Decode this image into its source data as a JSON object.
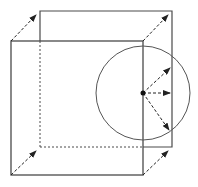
{
  "diagram": {
    "title": "",
    "colors": {
      "background": "#ffffff",
      "edge": "#4a4a4a",
      "arrow": "#222222",
      "circle": "#555555",
      "point": "#111111"
    },
    "front_face": {
      "x1": 11,
      "y1": 41,
      "x2": 143,
      "y2": 175
    },
    "back_face": {
      "x1": 40,
      "y1": 11,
      "x2": 172,
      "y2": 147
    },
    "hidden_edges": [
      {
        "x1": 40,
        "y1": 41,
        "x2": 40,
        "y2": 147
      },
      {
        "x1": 40,
        "y1": 147,
        "x2": 143,
        "y2": 147
      }
    ],
    "corner_arrows": [
      {
        "x1": 11,
        "y1": 41,
        "x2": 36,
        "y2": 15
      },
      {
        "x1": 143,
        "y1": 41,
        "x2": 168,
        "y2": 15
      },
      {
        "x1": 11,
        "y1": 175,
        "x2": 36,
        "y2": 151
      },
      {
        "x1": 143,
        "y1": 175,
        "x2": 168,
        "y2": 151
      }
    ],
    "circle": {
      "cx": 143,
      "cy": 93,
      "r": 47
    },
    "center_point": {
      "cx": 143,
      "cy": 93,
      "r": 2.5
    },
    "radial_arrows": [
      {
        "x1": 143,
        "y1": 93,
        "x2": 170,
        "y2": 68
      },
      {
        "x1": 143,
        "y1": 93,
        "x2": 170,
        "y2": 93
      },
      {
        "x1": 143,
        "y1": 93,
        "x2": 169,
        "y2": 130
      }
    ]
  }
}
